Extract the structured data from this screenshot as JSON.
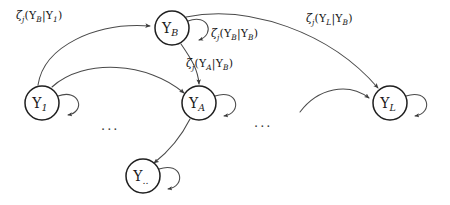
{
  "diagram": {
    "canvas": {
      "width": 450,
      "height": 205
    },
    "colors": {
      "background": "#ffffff",
      "node_stroke": "#1f1f1f",
      "node_fill": "#ffffff",
      "edge_stroke": "#4a4a4a",
      "text": "#161616"
    },
    "nodes": [
      {
        "id": "Y_B",
        "base": "Y",
        "subscript": "B",
        "cx": 172,
        "cy": 28,
        "r": 17,
        "self_loop": true
      },
      {
        "id": "Y_1",
        "base": "Y",
        "subscript": "1",
        "cx": 42,
        "cy": 103,
        "r": 17,
        "self_loop": true
      },
      {
        "id": "Y_A",
        "base": "Y",
        "subscript": "A",
        "cx": 199,
        "cy": 103,
        "r": 17,
        "self_loop": true
      },
      {
        "id": "Y_dots",
        "base": "Y",
        "subscript": "..",
        "cx": 143,
        "cy": 176,
        "r": 17,
        "self_loop": true
      },
      {
        "id": "Y_L",
        "base": "Y",
        "subscript": "L",
        "cx": 390,
        "cy": 103,
        "r": 17,
        "self_loop": true
      }
    ],
    "edges": [
      {
        "id": "e1",
        "from": "Y_1",
        "to": "Y_B",
        "label_id": "lbl_b_given_1"
      },
      {
        "id": "e2",
        "from": "Y_1",
        "to": "Y_A",
        "label_id": null
      },
      {
        "id": "e3",
        "from": "Y_B",
        "to": "Y_A",
        "label_id": "lbl_a_given_b"
      },
      {
        "id": "e4",
        "from": "Y_B",
        "to": "Y_L",
        "label_id": "lbl_l_given_b"
      },
      {
        "id": "e5",
        "from": "Y_A",
        "to": "Y_dots",
        "label_id": null
      },
      {
        "id": "e6",
        "from": "unlabeled-left",
        "to": "Y_L",
        "label_id": null
      },
      {
        "id": "e7",
        "from": "Y_B",
        "to": "Y_B",
        "label_id": "lbl_b_given_b"
      }
    ],
    "labels": [
      {
        "id": "lbl_b_given_1",
        "text": "ζj(YB|Y1)",
        "zeta": "ζ",
        "zeta_sub": "j",
        "open": "(",
        "num_var": "Y",
        "num_sub": "B",
        "bar": "|",
        "den_var": "Y",
        "den_sub": "1",
        "close": ")",
        "x": 16,
        "y": 9
      },
      {
        "id": "lbl_b_given_b",
        "text": "ζj(YB|YB)",
        "zeta": "ζ",
        "zeta_sub": "j",
        "open": "(",
        "num_var": "Y",
        "num_sub": "B",
        "bar": "|",
        "den_var": "Y",
        "den_sub": "B",
        "close": ")",
        "x": 211,
        "y": 27
      },
      {
        "id": "lbl_a_given_b",
        "text": "ζj(YA|YB)",
        "zeta": "ζ",
        "zeta_sub": "j",
        "open": "(",
        "num_var": "Y",
        "num_sub": "A",
        "bar": "|",
        "den_var": "Y",
        "den_sub": "B",
        "close": ")",
        "x": 186,
        "y": 57
      },
      {
        "id": "lbl_l_given_b",
        "text": "ζj(YL|YB)",
        "zeta": "ζ",
        "zeta_sub": "j",
        "open": "(",
        "num_var": "Y",
        "num_sub": "L",
        "bar": "|",
        "den_var": "Y",
        "den_sub": "B",
        "close": ")",
        "x": 306,
        "y": 12
      }
    ],
    "ellipses": [
      {
        "id": "ellipsis_left",
        "text": "...",
        "x": 101,
        "y": 118
      },
      {
        "id": "ellipsis_right",
        "text": "...",
        "x": 254,
        "y": 115
      }
    ]
  }
}
